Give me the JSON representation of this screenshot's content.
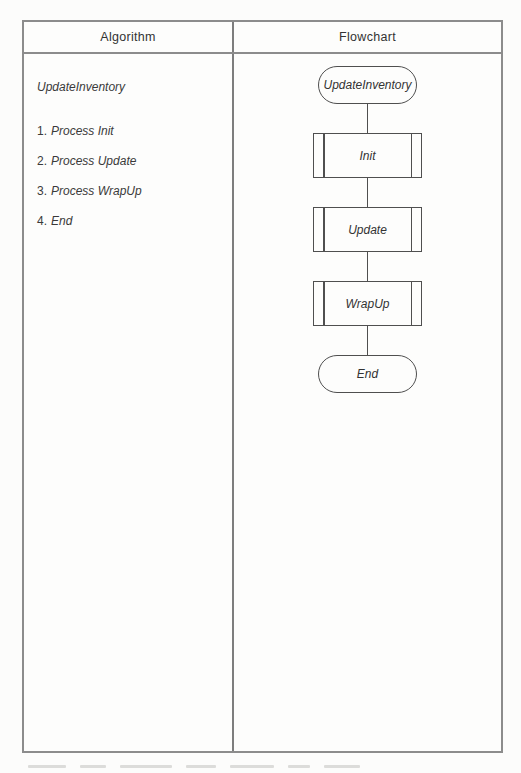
{
  "table": {
    "headers": [
      "Algorithm",
      "Flowchart"
    ]
  },
  "algorithm": {
    "title": "UpdateInventory",
    "steps": [
      {
        "num": "1.",
        "text": "Process Init"
      },
      {
        "num": "2.",
        "text": "Process Update"
      },
      {
        "num": "3.",
        "text": "Process WrapUp"
      },
      {
        "num": "4.",
        "text": "End"
      }
    ]
  },
  "flowchart": {
    "nodes": [
      {
        "type": "terminal",
        "label": "UpdateInventory"
      },
      {
        "type": "predefined-process",
        "label": "Init"
      },
      {
        "type": "predefined-process",
        "label": "Update"
      },
      {
        "type": "predefined-process",
        "label": "WrapUp"
      },
      {
        "type": "terminal",
        "label": "End"
      }
    ]
  },
  "colors": {
    "paper": "#fcfcfb",
    "table_border": "#8c8c8c",
    "flowchart_line": "#4f4f4f",
    "text": "#333333"
  }
}
